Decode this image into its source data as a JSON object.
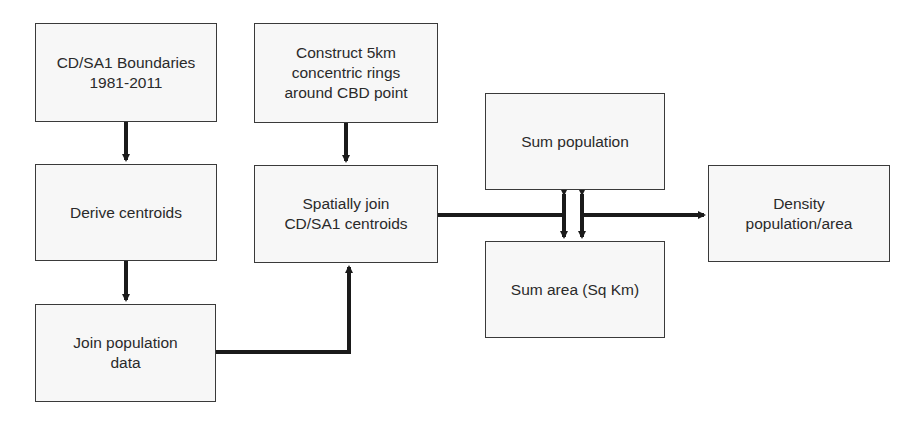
{
  "diagram": {
    "type": "flowchart",
    "nodes": [
      {
        "id": "boundaries",
        "label": "CD/SA1 Boundaries\n1981-2011"
      },
      {
        "id": "rings",
        "label": "Construct 5km\nconcentric rings\naround CBD point"
      },
      {
        "id": "centroids",
        "label": "Derive centroids"
      },
      {
        "id": "spatial_join",
        "label": "Spatially join\nCD/SA1 centroids"
      },
      {
        "id": "join_pop",
        "label": "Join population\ndata"
      },
      {
        "id": "sum_pop",
        "label": "Sum population"
      },
      {
        "id": "sum_area",
        "label": "Sum area (Sq Km)"
      },
      {
        "id": "density",
        "label": "Density\npopulation/area"
      }
    ],
    "edges": [
      {
        "from": "boundaries",
        "to": "centroids"
      },
      {
        "from": "centroids",
        "to": "join_pop"
      },
      {
        "from": "join_pop",
        "to": "spatial_join"
      },
      {
        "from": "rings",
        "to": "spatial_join"
      },
      {
        "from": "spatial_join",
        "to": "sum_pop"
      },
      {
        "from": "spatial_join",
        "to": "sum_area"
      },
      {
        "from": "spatial_join",
        "to": "density"
      }
    ],
    "colors": {
      "box_fill": "#f7f7f7",
      "box_border": "#3a3a3a",
      "arrow": "#1a1a1a",
      "text": "#2a2a2a"
    }
  }
}
